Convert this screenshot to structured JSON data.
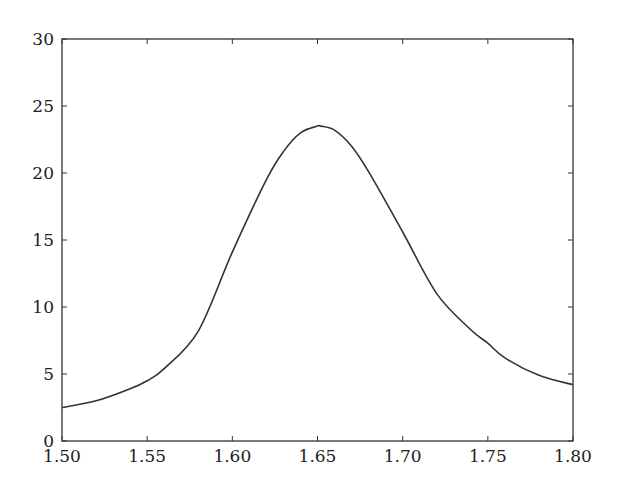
{
  "chart_data": {
    "type": "line",
    "title": "",
    "xlabel": "",
    "ylabel": "",
    "xlim": [
      1.5,
      1.8
    ],
    "ylim": [
      0,
      30
    ],
    "grid": false,
    "legend": null,
    "x_ticks": [
      "1.50",
      "1.55",
      "1.60",
      "1.65",
      "1.70",
      "1.75",
      "1.80"
    ],
    "y_ticks": [
      "0",
      "5",
      "10",
      "15",
      "20",
      "25",
      "30"
    ],
    "series": [
      {
        "name": "curve",
        "color": "#333333",
        "x": [
          1.5,
          1.52,
          1.54,
          1.55,
          1.56,
          1.58,
          1.6,
          1.62,
          1.63,
          1.64,
          1.65,
          1.652,
          1.66,
          1.67,
          1.68,
          1.7,
          1.72,
          1.74,
          1.75,
          1.76,
          1.78,
          1.8
        ],
        "y": [
          2.5,
          3.0,
          3.9,
          4.5,
          5.4,
          8.2,
          14.1,
          19.5,
          21.6,
          23.0,
          23.5,
          23.5,
          23.2,
          22.0,
          20.1,
          15.6,
          11.0,
          8.3,
          7.3,
          6.2,
          4.9,
          4.2
        ]
      }
    ]
  }
}
